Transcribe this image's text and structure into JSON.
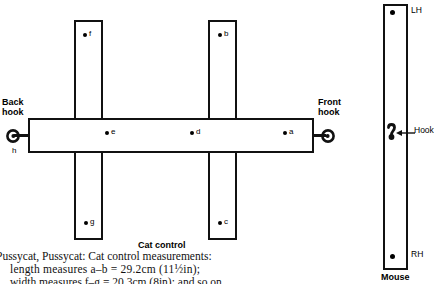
{
  "figure": {
    "cat": {
      "caption": "Cat control",
      "back_hook_label": "Back\nhook",
      "back_hook_line1": "Back",
      "back_hook_line2": "hook",
      "front_hook_line1": "Front",
      "front_hook_line2": "hook",
      "points": [
        {
          "id": "a",
          "label": "a"
        },
        {
          "id": "b",
          "label": "b"
        },
        {
          "id": "c",
          "label": "c"
        },
        {
          "id": "d",
          "label": "d"
        },
        {
          "id": "e",
          "label": "e"
        },
        {
          "id": "f",
          "label": "f"
        },
        {
          "id": "g",
          "label": "g"
        },
        {
          "id": "h",
          "label": "h"
        }
      ]
    },
    "mouse": {
      "caption": "Mouse",
      "top_label": "LH",
      "bottom_label": "RH",
      "hook_label": "Hook"
    }
  },
  "body_text": {
    "line1": "Pussycat, Pussycat: Cat control measurements:",
    "line2": "length measures a–b = 29.2cm (11½in);",
    "line3": "width measures f–g = 20.3cm (8in); and so on"
  },
  "colors": {
    "ink": "#111111",
    "paper": "#ffffff"
  }
}
